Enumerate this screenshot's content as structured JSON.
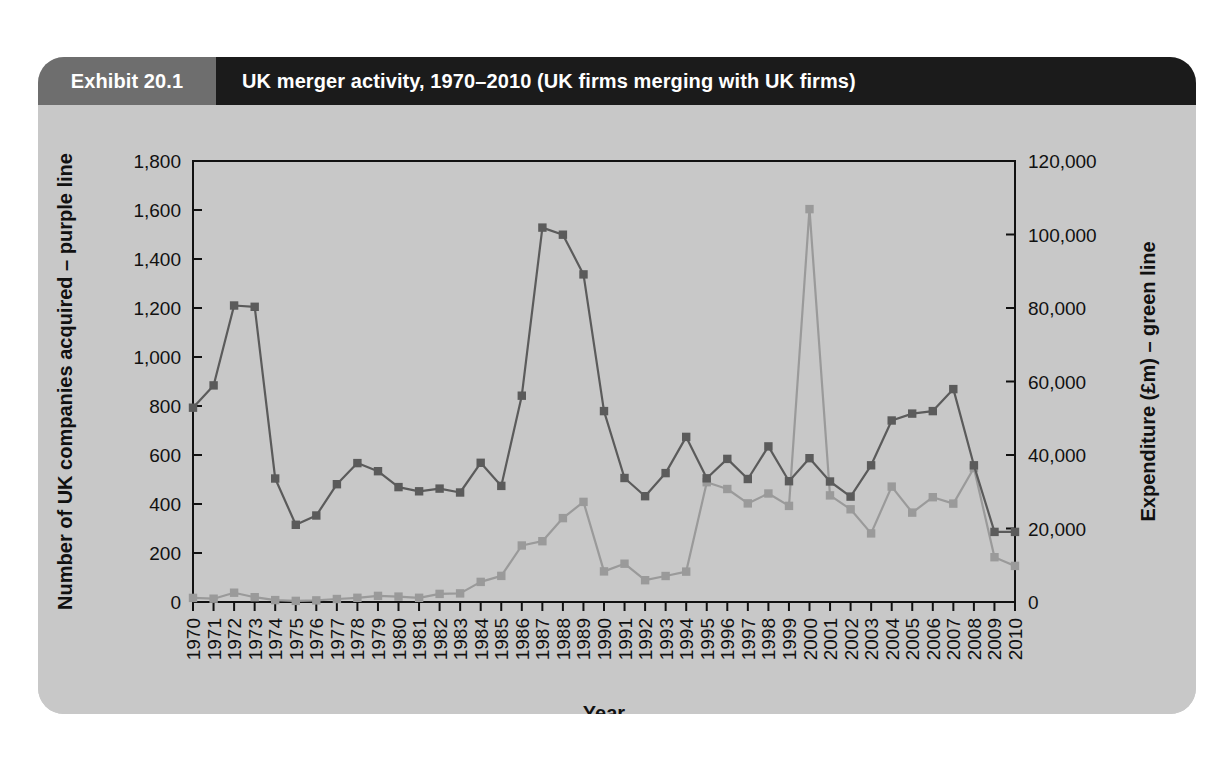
{
  "exhibit": {
    "number_label": "Exhibit 20.1",
    "title": "UK merger activity, 1970–2010 (UK firms merging with UK firms)"
  },
  "colors": {
    "panel_background": "#c8c8c8",
    "header_tab": "#6e6e6e",
    "header_bar": "#1b1b1b",
    "header_text": "#ffffff",
    "axis": "#111111",
    "purple_line": "#5b5b5b",
    "green_line": "#9a9a9a",
    "text": "#111111"
  },
  "chart_data": {
    "type": "line",
    "title": "UK merger activity, 1970–2010 (UK firms merging with UK firms)",
    "xlabel": "Year",
    "grid": false,
    "legend_position": "axis-labels",
    "categories": [
      "1970",
      "1971",
      "1972",
      "1973",
      "1974",
      "1975",
      "1976",
      "1977",
      "1978",
      "1979",
      "1980",
      "1981",
      "1982",
      "1983",
      "1984",
      "1985",
      "1986",
      "1987",
      "1988",
      "1989",
      "1990",
      "1991",
      "1992",
      "1993",
      "1994",
      "1995",
      "1996",
      "1997",
      "1998",
      "1999",
      "2000",
      "2001",
      "2002",
      "2003",
      "2004",
      "2005",
      "2006",
      "2007",
      "2008",
      "2009",
      "2010"
    ],
    "axes": [
      {
        "id": "left",
        "label": "Number of UK companies acquired – purple line",
        "ylim": [
          0,
          1800
        ],
        "ticks": [
          0,
          200,
          400,
          600,
          800,
          1000,
          1200,
          1400,
          1600,
          1800
        ],
        "ticklabels": [
          "0",
          "200",
          "400",
          "600",
          "800",
          "1,000",
          "1,200",
          "1,400",
          "1,600",
          "1,800"
        ]
      },
      {
        "id": "right",
        "label": "Expenditure (£m) – green line",
        "ylim": [
          0,
          120000
        ],
        "ticks": [
          0,
          20000,
          40000,
          60000,
          80000,
          100000,
          120000
        ],
        "ticklabels": [
          "0",
          "20,000",
          "40,000",
          "60,000",
          "80,000",
          "100,000",
          "120,000"
        ]
      }
    ],
    "series": [
      {
        "name": "Number of UK companies acquired",
        "axis": "left",
        "color": "#5b5b5b",
        "marker": "square",
        "values": [
          793,
          884,
          1210,
          1205,
          504,
          315,
          353,
          481,
          567,
          534,
          469,
          452,
          463,
          447,
          568,
          474,
          842,
          1528,
          1499,
          1337,
          779,
          506,
          432,
          526,
          674,
          505,
          584,
          502,
          635,
          493,
          587,
          492,
          430,
          558,
          741,
          769,
          779,
          869,
          558,
          286,
          286
        ]
      },
      {
        "name": "Expenditure (£m)",
        "axis": "right",
        "color": "#9a9a9a",
        "marker": "square",
        "values": [
          1122,
          911,
          2532,
          1304,
          508,
          291,
          448,
          824,
          1140,
          1656,
          1475,
          1144,
          2206,
          2343,
          5474,
          7090,
          15370,
          16539,
          22839,
          27250,
          8329,
          10434,
          5941,
          7063,
          8269,
          32600,
          30742,
          26829,
          29525,
          26163,
          106916,
          28994,
          25236,
          18679,
          31408,
          24319,
          28511,
          26778,
          36469,
          12186,
          9832
        ]
      }
    ]
  }
}
